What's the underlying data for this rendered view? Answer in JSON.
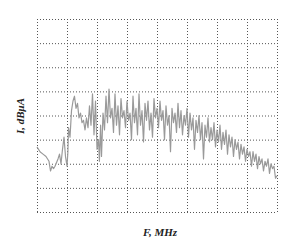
{
  "chart_data": {
    "type": "line",
    "title": "",
    "xlabel": "F, MHz",
    "ylabel": "I, dBμA",
    "grid": true,
    "grid_style": "dotted",
    "grid_columns": 8,
    "grid_rows": 8,
    "legend": null,
    "tick_labels": false,
    "series": [
      {
        "name": "current spectrum",
        "color": "#9a9a9a",
        "note": "x and y in normalized grid units: x from 0 (left) to 8 (right), y from 0 (bottom) to 8 (top)",
        "points": [
          [
            0.0,
            2.7
          ],
          [
            0.1,
            2.5
          ],
          [
            0.2,
            2.4
          ],
          [
            0.3,
            2.3
          ],
          [
            0.4,
            2.1
          ],
          [
            0.45,
            1.7
          ],
          [
            0.5,
            1.9
          ],
          [
            0.55,
            1.8
          ],
          [
            0.6,
            1.9
          ],
          [
            0.7,
            2.2
          ],
          [
            0.75,
            2.4
          ],
          [
            0.8,
            2.0
          ],
          [
            0.85,
            2.6
          ],
          [
            0.9,
            3.1
          ],
          [
            0.95,
            2.3
          ],
          [
            1.0,
            1.9
          ],
          [
            1.03,
            2.5
          ],
          [
            1.05,
            3.5
          ],
          [
            1.1,
            3.1
          ],
          [
            1.15,
            4.2
          ],
          [
            1.2,
            4.6
          ],
          [
            1.25,
            4.8
          ],
          [
            1.3,
            4.3
          ],
          [
            1.35,
            4.5
          ],
          [
            1.4,
            3.9
          ],
          [
            1.45,
            4.1
          ],
          [
            1.5,
            3.7
          ],
          [
            1.55,
            3.8
          ],
          [
            1.6,
            3.4
          ],
          [
            1.65,
            3.9
          ],
          [
            1.7,
            3.5
          ],
          [
            1.75,
            4.4
          ],
          [
            1.8,
            3.6
          ],
          [
            1.85,
            4.9
          ],
          [
            1.9,
            3.2
          ],
          [
            1.95,
            4.6
          ],
          [
            2.0,
            2.6
          ],
          [
            2.05,
            3.0
          ],
          [
            2.08,
            2.1
          ],
          [
            2.12,
            3.6
          ],
          [
            2.15,
            2.3
          ],
          [
            2.2,
            4.1
          ],
          [
            2.25,
            3.4
          ],
          [
            2.3,
            4.8
          ],
          [
            2.35,
            3.7
          ],
          [
            2.4,
            5.1
          ],
          [
            2.45,
            3.9
          ],
          [
            2.5,
            4.3
          ],
          [
            2.55,
            3.3
          ],
          [
            2.6,
            4.9
          ],
          [
            2.65,
            3.6
          ],
          [
            2.7,
            4.4
          ],
          [
            2.75,
            3.2
          ],
          [
            2.8,
            4.7
          ],
          [
            2.85,
            3.9
          ],
          [
            2.9,
            4.2
          ],
          [
            2.95,
            3.5
          ],
          [
            3.0,
            4.6
          ],
          [
            3.05,
            3.8
          ],
          [
            3.1,
            4.1
          ],
          [
            3.15,
            3.0
          ],
          [
            3.2,
            4.8
          ],
          [
            3.25,
            3.7
          ],
          [
            3.3,
            4.3
          ],
          [
            3.35,
            3.2
          ],
          [
            3.4,
            4.9
          ],
          [
            3.45,
            3.6
          ],
          [
            3.5,
            4.2
          ],
          [
            3.55,
            2.9
          ],
          [
            3.6,
            4.5
          ],
          [
            3.65,
            3.8
          ],
          [
            3.7,
            4.6
          ],
          [
            3.75,
            3.4
          ],
          [
            3.8,
            4.1
          ],
          [
            3.85,
            3.1
          ],
          [
            3.9,
            4.7
          ],
          [
            3.95,
            3.9
          ],
          [
            4.0,
            4.3
          ],
          [
            4.05,
            3.5
          ],
          [
            4.1,
            4.6
          ],
          [
            4.15,
            3.8
          ],
          [
            4.2,
            4.2
          ],
          [
            4.25,
            3.0
          ],
          [
            4.3,
            4.4
          ],
          [
            4.35,
            3.6
          ],
          [
            4.4,
            4.0
          ],
          [
            4.45,
            2.5
          ],
          [
            4.5,
            4.3
          ],
          [
            4.55,
            3.7
          ],
          [
            4.6,
            4.1
          ],
          [
            4.65,
            3.3
          ],
          [
            4.7,
            4.5
          ],
          [
            4.75,
            3.5
          ],
          [
            4.8,
            4.2
          ],
          [
            4.85,
            3.2
          ],
          [
            4.9,
            4.0
          ],
          [
            4.95,
            3.6
          ],
          [
            5.0,
            4.3
          ],
          [
            5.05,
            3.1
          ],
          [
            5.1,
            4.1
          ],
          [
            5.15,
            3.4
          ],
          [
            5.2,
            3.9
          ],
          [
            5.25,
            2.6
          ],
          [
            5.3,
            3.8
          ],
          [
            5.35,
            3.3
          ],
          [
            5.4,
            4.0
          ],
          [
            5.45,
            3.0
          ],
          [
            5.5,
            3.7
          ],
          [
            5.55,
            2.2
          ],
          [
            5.6,
            3.6
          ],
          [
            5.65,
            3.1
          ],
          [
            5.7,
            3.9
          ],
          [
            5.75,
            2.9
          ],
          [
            5.8,
            3.5
          ],
          [
            5.85,
            3.0
          ],
          [
            5.9,
            3.7
          ],
          [
            5.95,
            2.7
          ],
          [
            6.0,
            3.4
          ],
          [
            6.05,
            2.9
          ],
          [
            6.1,
            3.6
          ],
          [
            6.15,
            2.6
          ],
          [
            6.2,
            3.3
          ],
          [
            6.25,
            2.8
          ],
          [
            6.3,
            3.4
          ],
          [
            6.35,
            2.4
          ],
          [
            6.4,
            3.2
          ],
          [
            6.45,
            2.7
          ],
          [
            6.5,
            3.1
          ],
          [
            6.55,
            2.3
          ],
          [
            6.6,
            3.0
          ],
          [
            6.65,
            2.6
          ],
          [
            6.7,
            2.9
          ],
          [
            6.75,
            2.2
          ],
          [
            6.8,
            2.8
          ],
          [
            6.85,
            2.4
          ],
          [
            6.9,
            2.7
          ],
          [
            6.95,
            2.1
          ],
          [
            7.0,
            2.6
          ],
          [
            7.05,
            2.3
          ],
          [
            7.1,
            2.5
          ],
          [
            7.15,
            1.9
          ],
          [
            7.2,
            2.5
          ],
          [
            7.25,
            2.1
          ],
          [
            7.3,
            2.4
          ],
          [
            7.35,
            1.8
          ],
          [
            7.4,
            2.3
          ],
          [
            7.45,
            2.0
          ],
          [
            7.5,
            2.2
          ],
          [
            7.55,
            1.7
          ],
          [
            7.6,
            2.1
          ],
          [
            7.65,
            1.9
          ],
          [
            7.7,
            2.2
          ],
          [
            7.75,
            1.6
          ],
          [
            7.8,
            2.0
          ],
          [
            7.85,
            1.8
          ],
          [
            7.9,
            1.9
          ],
          [
            7.95,
            1.4
          ],
          [
            8.0,
            1.5
          ]
        ]
      }
    ]
  },
  "axes": {
    "xlabel": "F, MHz",
    "ylabel": "I, dBμA"
  },
  "plot_area": {
    "left": 37,
    "top": 19,
    "width": 240,
    "height": 193,
    "grid_color": "#555555",
    "trace_color": "#9a9a9a"
  }
}
